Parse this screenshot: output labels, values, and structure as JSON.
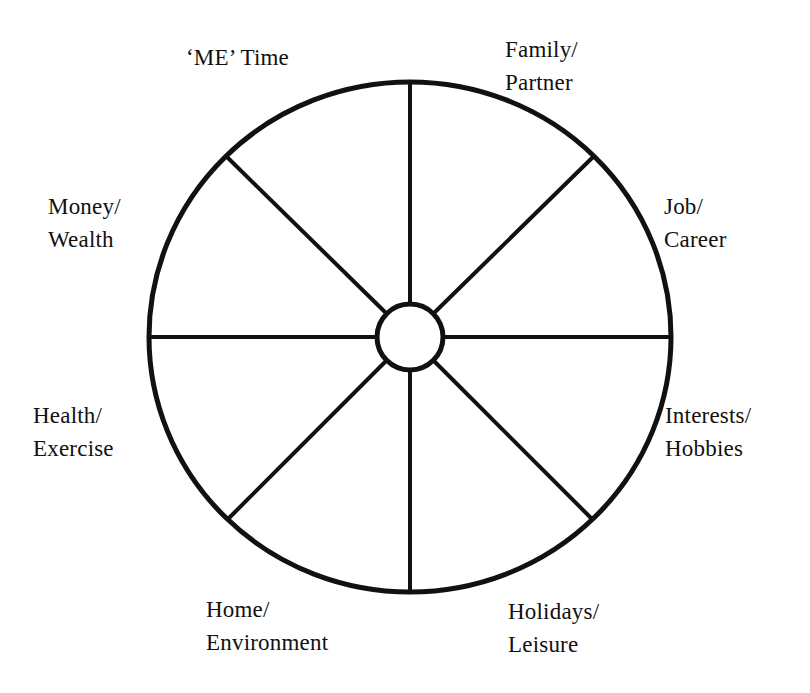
{
  "diagram": {
    "type": "wheel-of-life",
    "segment_count": 8,
    "colors": {
      "background": "#ffffff",
      "stroke": "#111111",
      "hub_fill": "#ffffff"
    },
    "geometry": {
      "center_x": 410,
      "center_y": 337,
      "radius_x": 261,
      "radius_y": 255,
      "hub_radius": 33,
      "outer_stroke_width": 5,
      "spoke_stroke_width": 4,
      "hub_stroke_width": 5
    },
    "segments": [
      {
        "id": "me-time",
        "label": "‘ME’ Time",
        "lines": [
          "‘ME’ Time"
        ],
        "angle_deg": 292.5
      },
      {
        "id": "family-partner",
        "label": "Family/ Partner",
        "lines": [
          "Family/",
          "Partner"
        ],
        "angle_deg": 247.5
      },
      {
        "id": "job-career",
        "label": "Job/ Career",
        "lines": [
          "Job/",
          "Career"
        ],
        "angle_deg": 202.5
      },
      {
        "id": "interests-hobbies",
        "label": "Interests/ Hobbies",
        "lines": [
          "Interests/",
          "Hobbies"
        ],
        "angle_deg": 157.5
      },
      {
        "id": "holidays-leisure",
        "label": "Holidays/ Leisure",
        "lines": [
          "Holidays/",
          "Leisure"
        ],
        "angle_deg": 112.5
      },
      {
        "id": "home-environment",
        "label": "Home/ Environment",
        "lines": [
          "Home/",
          "Environment"
        ],
        "angle_deg": 67.5
      },
      {
        "id": "health-exercise",
        "label": "Health/ Exercise",
        "lines": [
          "Health/",
          "Exercise"
        ],
        "angle_deg": 22.5
      },
      {
        "id": "money-wealth",
        "label": "Money/ Wealth",
        "lines": [
          "Money/",
          "Wealth"
        ],
        "angle_deg": 337.5
      }
    ],
    "labels": {
      "me_time": "‘ME’ Time",
      "family_partner": "Family/\nPartner",
      "job_career": "Job/\nCareer",
      "interests_hobbies": "Interests/\nHobbies",
      "holidays_leisure": "Holidays/\nLeisure",
      "home_environment": "Home/\nEnvironment",
      "health_exercise": "Health/\nExercise",
      "money_wealth": "Money/\nWealth"
    }
  }
}
